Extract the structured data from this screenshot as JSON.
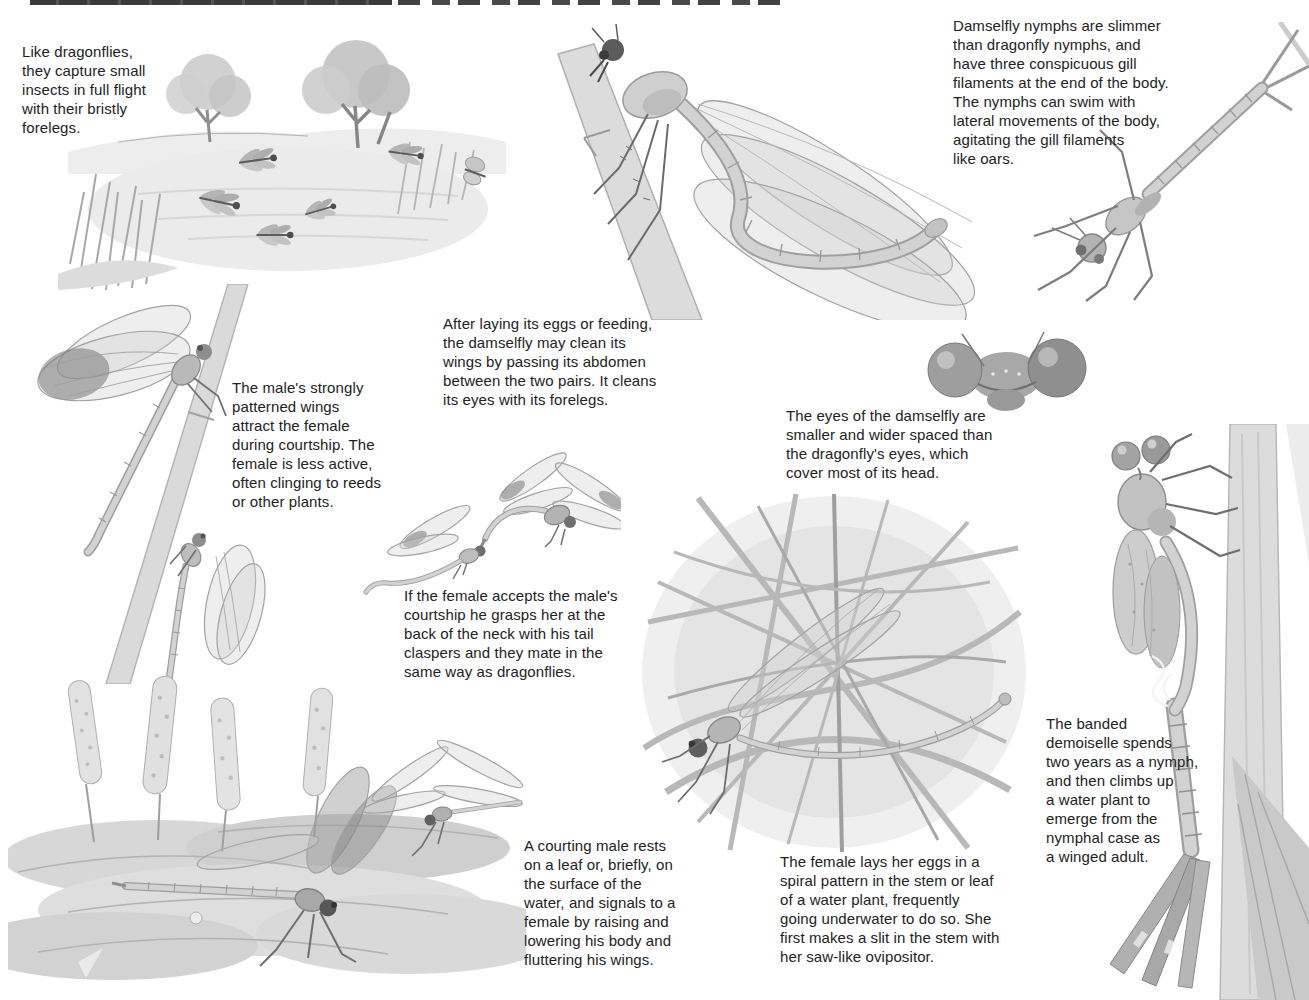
{
  "page": {
    "type": "illustrated-book-page",
    "colors": {
      "paper": "#ffffff",
      "text": "#222222",
      "header_band": "#3a3a3a",
      "sketch_light": "#d9d9d9",
      "sketch_mid": "#a8a8a8",
      "sketch_dark": "#555555"
    }
  },
  "captions": {
    "forelegs": "Like dragonflies,\nthey capture small\ninsects in full flight\nwith their bristly\nforelegs.",
    "nymphs": "Damselfly nymphs are slimmer\nthan dragonfly nymphs, and\nhave three conspicuous gill\nfilaments at the end of the body.\nThe nymphs can swim with\nlateral movements of the body,\nagitating the gill filaments\nlike oars.",
    "male_wings": "The male's strongly\npatterned wings\nattract the female\nduring courtship. The\nfemale is less active,\noften clinging to reeds\nor other plants.",
    "cleaning": "After laying its eggs or feeding,\nthe damselfly may clean its\nwings by passing its abdomen\nbetween the two pairs. It cleans\nits eyes with its forelegs.",
    "eyes": "The eyes of the damselfly are\nsmaller and wider spaced than\nthe dragonfly's eyes, which\ncover most of its head.",
    "mating": "If the female accepts the male's\ncourtship he grasps her at the\nback of the neck with his tail\nclaspers and they mate in the\nsame way as dragonflies.",
    "courting_male": "A courting male rests\non a leaf or, briefly, on\nthe surface of the\nwater, and signals to a\nfemale by raising and\nlowering his body and\nfluttering his wings.",
    "egg_laying": "The female lays her eggs in a\nspiral pattern in the stem or leaf\nof a water plant, frequently\ngoing underwater to do so. She\nfirst makes a slit in the stem with\nher saw-like ovipositor.",
    "banded_demoiselle": "The banded\ndemoiselle spends\ntwo years as a nymph,\nand then climbs up\na water plant to\nemerge from the\nnymphal case as\na winged adult."
  },
  "illustrations": {
    "pond_scene": "pond with trees, reeds and flying damselflies",
    "cleaning_damselfly": "damselfly on a stem cleaning its wings",
    "nymph": "damselfly nymph with three gill filaments",
    "reed_pair": "male with banded wings and female on a reed",
    "tandem_pair": "mating pair flying in tandem",
    "head_closeup": "damselfly head with wide-spaced eyes",
    "egg_laying_scene": "female laying eggs among grass stems",
    "water_scene": "courting male on leaves with flower spikes",
    "emergence": "banded demoiselle emerging from nymphal case"
  }
}
